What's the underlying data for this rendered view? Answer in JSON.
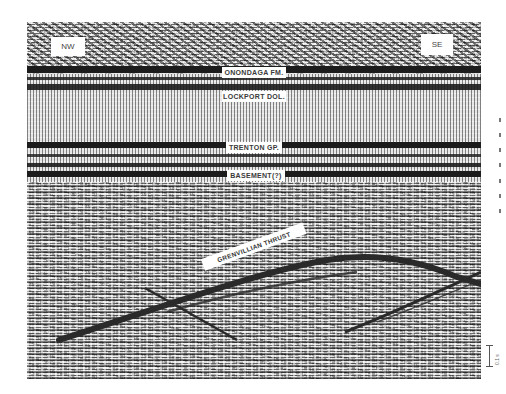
{
  "figure": {
    "type": "seismic-reflection-profile",
    "orientation": {
      "left_label": "NW",
      "right_label": "SE"
    },
    "horizons": [
      {
        "label": "ONONDAGA FM.",
        "y": 72
      },
      {
        "label": "LOCKPORT DOL.",
        "y": 96
      },
      {
        "label": "TRENTON GP.",
        "y": 147
      },
      {
        "label": "BASEMENT(?)",
        "y": 174
      }
    ],
    "fault": {
      "label": "GRENVILLIAN THRUST"
    },
    "scale_bar": {
      "label": "0.1 s"
    },
    "colors": {
      "reflector": "#1c1c1c",
      "label_background": "#ffffff",
      "label_text": "#3a3a3a"
    }
  }
}
